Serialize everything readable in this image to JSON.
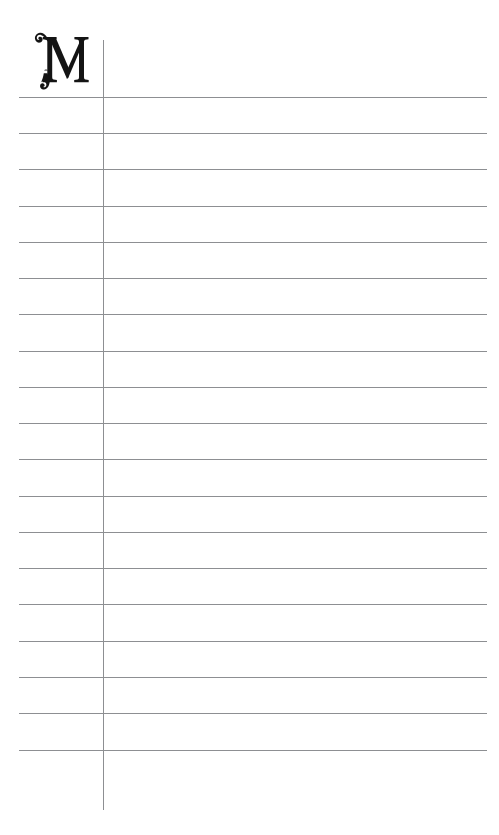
{
  "page": {
    "kind": "ruled-notebook-page",
    "width": 499,
    "height": 835,
    "background_color": "#ffffff",
    "rule_color": "#8d8f92",
    "ink_color": "#141414"
  },
  "dropcap": {
    "letter": "M",
    "style": "ornamental-swash-serif",
    "icon_name": "ornamental-letter-m",
    "color": "#141414",
    "left": 30,
    "top": 24,
    "width": 62,
    "height": 70
  },
  "rules": {
    "horizontal": {
      "count": 19,
      "x_start": 19,
      "x_end": 487,
      "spacing": 36.3,
      "y_positions": [
        97,
        133,
        169,
        206,
        242,
        278,
        314,
        351,
        387,
        423,
        459,
        496,
        532,
        568,
        604,
        641,
        677,
        713,
        750
      ],
      "color": "#8d8f92",
      "thickness": 1
    },
    "vertical": {
      "count": 1,
      "x_positions": [
        103
      ],
      "y_start": 40,
      "y_end": 810,
      "color": "#8d8f92",
      "thickness": 1
    }
  }
}
